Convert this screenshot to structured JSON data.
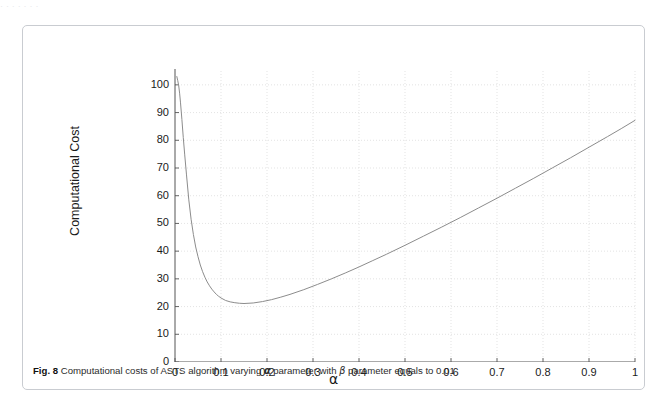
{
  "page": {
    "top_bleed_text": "· ·   ·     ·        ·          ·              ·"
  },
  "caption": {
    "fig_number": "Fig. 8",
    "text_before_alpha": " Computational costs of ASTS algorithm varying ",
    "alpha_symbol": "α",
    "text_between": " parameter with ",
    "beta_symbol": "β",
    "text_after_beta": " parameter equals to 0.01"
  },
  "chart_data": {
    "type": "line",
    "title": "",
    "xlabel": "α",
    "ylabel": "Computational Cost",
    "xlim": [
      0,
      1
    ],
    "ylim": [
      0,
      105
    ],
    "grid": true,
    "legend": null,
    "xticks": [
      0,
      0.1,
      0.2,
      0.3,
      0.4,
      0.5,
      0.6,
      0.7,
      0.8,
      0.9,
      1
    ],
    "xtick_labels": [
      "0",
      "0.1",
      "0.2",
      "0.3",
      "0.4",
      "0.5",
      "0.6",
      "0.7",
      "0.8",
      "0.9",
      "1"
    ],
    "yticks": [
      0,
      10,
      20,
      30,
      40,
      50,
      60,
      70,
      80,
      90,
      100
    ],
    "ytick_labels": [
      "0",
      "10",
      "20",
      "30",
      "40",
      "50",
      "60",
      "70",
      "80",
      "90",
      "100"
    ],
    "line_color": "#8c8c8c",
    "series": [
      {
        "name": "Computational cost",
        "x": [
          0.004,
          0.006,
          0.008,
          0.01,
          0.012,
          0.015,
          0.018,
          0.021,
          0.025,
          0.03,
          0.035,
          0.04,
          0.045,
          0.05,
          0.055,
          0.06,
          0.065,
          0.07,
          0.075,
          0.08,
          0.085,
          0.09,
          0.095,
          0.1,
          0.11,
          0.12,
          0.13,
          0.14,
          0.15,
          0.17,
          0.19,
          0.21,
          0.23,
          0.25,
          0.28,
          0.31,
          0.34,
          0.37,
          0.4,
          0.43,
          0.46,
          0.5,
          0.54,
          0.58,
          0.62,
          0.66,
          0.7,
          0.74,
          0.78,
          0.82,
          0.86,
          0.9,
          0.94,
          0.97,
          1.0
        ],
        "y": [
          103.0,
          101.5,
          99.8,
          97.0,
          93.5,
          87.5,
          81.0,
          75.0,
          67.5,
          58.5,
          51.5,
          46.0,
          41.5,
          38.0,
          35.0,
          32.6,
          30.6,
          28.9,
          27.5,
          26.3,
          25.3,
          24.4,
          23.7,
          23.1,
          22.2,
          21.7,
          21.4,
          21.2,
          21.1,
          21.3,
          21.8,
          22.5,
          23.4,
          24.4,
          26.1,
          28.0,
          30.0,
          32.1,
          34.3,
          36.6,
          38.9,
          42.1,
          45.4,
          48.7,
          52.1,
          55.6,
          59.1,
          62.7,
          66.3,
          70.0,
          73.7,
          77.5,
          81.3,
          84.2,
          87.2
        ]
      }
    ],
    "minimum": {
      "x": 0.1,
      "y": 21.1
    },
    "endpoint": {
      "x": 1.0,
      "y": 87.2
    }
  }
}
